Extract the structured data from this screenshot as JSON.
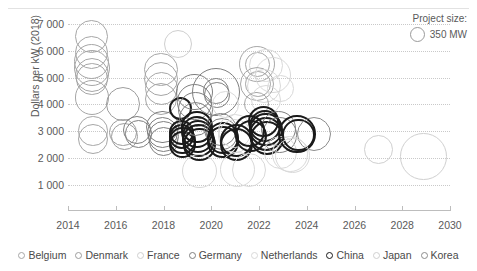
{
  "chart_data": {
    "type": "scatter",
    "title": "",
    "xlabel": "",
    "ylabel": "Dollars per kW (2018)",
    "xlim": [
      2014,
      2030
    ],
    "ylim": [
      500,
      7300
    ],
    "xticks": [
      "2014",
      "2016",
      "2018",
      "2020",
      "2022",
      "2024",
      "2026",
      "2028",
      "2030"
    ],
    "xtick_values": [
      2014,
      2016,
      2018,
      2020,
      2022,
      2024,
      2026,
      2028,
      2030
    ],
    "yticks": [
      "1 000",
      "2 000",
      "3 000",
      "4 000",
      "5 000",
      "6 000",
      "7 000"
    ],
    "ytick_values": [
      1000,
      2000,
      3000,
      4000,
      5000,
      6000,
      7000
    ],
    "grid": true,
    "grid_style": "dotted-horizontal",
    "size_legend": {
      "title": "Project size:",
      "value_label": "350 MW",
      "value_mw": 350
    },
    "legend_position": "bottom",
    "series": [
      {
        "name": "Belgium",
        "color": "#a6a6a6"
      },
      {
        "name": "Denmark",
        "color": "#9d9d9d"
      },
      {
        "name": "France",
        "color": "#cfcfcf"
      },
      {
        "name": "Germany",
        "color": "#7f7f7f"
      },
      {
        "name": "Netherlands",
        "color": "#d9d9d9"
      },
      {
        "name": "China",
        "color": "#1a1a1a"
      },
      {
        "name": "Japan",
        "color": "#d0d0d0"
      },
      {
        "name": "Korea",
        "color": "#8c8c8c"
      }
    ],
    "points": [
      {
        "s": 0,
        "x": 2015.0,
        "y": 6550,
        "mw": 165
      },
      {
        "s": 0,
        "x": 2015.0,
        "y": 5950,
        "mw": 165
      },
      {
        "s": 0,
        "x": 2015.0,
        "y": 5600,
        "mw": 185
      },
      {
        "s": 0,
        "x": 2015.0,
        "y": 5350,
        "mw": 200
      },
      {
        "s": 0,
        "x": 2015.0,
        "y": 5100,
        "mw": 175
      },
      {
        "s": 0,
        "x": 2015.0,
        "y": 4950,
        "mw": 150
      },
      {
        "s": 0,
        "x": 2015.0,
        "y": 4250,
        "mw": 180
      },
      {
        "s": 0,
        "x": 2015.05,
        "y": 3000,
        "mw": 130
      },
      {
        "s": 0,
        "x": 2015.05,
        "y": 2700,
        "mw": 140
      },
      {
        "s": 1,
        "x": 2016.3,
        "y": 4000,
        "mw": 175
      },
      {
        "s": 1,
        "x": 2016.3,
        "y": 2950,
        "mw": 115
      },
      {
        "s": 1,
        "x": 2016.35,
        "y": 2800,
        "mw": 110
      },
      {
        "s": 3,
        "x": 2016.9,
        "y": 3050,
        "mw": 120
      },
      {
        "s": 3,
        "x": 2016.95,
        "y": 2900,
        "mw": 115
      },
      {
        "s": 0,
        "x": 2017.9,
        "y": 5300,
        "mw": 170
      },
      {
        "s": 0,
        "x": 2017.9,
        "y": 4950,
        "mw": 175
      },
      {
        "s": 0,
        "x": 2017.9,
        "y": 4600,
        "mw": 165
      },
      {
        "s": 0,
        "x": 2017.9,
        "y": 4200,
        "mw": 160
      },
      {
        "s": 3,
        "x": 2017.95,
        "y": 3150,
        "mw": 160
      },
      {
        "s": 3,
        "x": 2017.95,
        "y": 2950,
        "mw": 150
      },
      {
        "s": 3,
        "x": 2018.0,
        "y": 2800,
        "mw": 145
      },
      {
        "s": 3,
        "x": 2018.0,
        "y": 2600,
        "mw": 130
      },
      {
        "s": 2,
        "x": 2018.6,
        "y": 6250,
        "mw": 120
      },
      {
        "s": 5,
        "x": 2018.7,
        "y": 3850,
        "mw": 80
      },
      {
        "s": 5,
        "x": 2018.75,
        "y": 2950,
        "mw": 95
      },
      {
        "s": 5,
        "x": 2018.75,
        "y": 2800,
        "mw": 100
      },
      {
        "s": 5,
        "x": 2018.8,
        "y": 2650,
        "mw": 105
      },
      {
        "s": 5,
        "x": 2018.8,
        "y": 2500,
        "mw": 110
      },
      {
        "s": 3,
        "x": 2019.3,
        "y": 4450,
        "mw": 200
      },
      {
        "s": 3,
        "x": 2019.3,
        "y": 4100,
        "mw": 195
      },
      {
        "s": 3,
        "x": 2019.35,
        "y": 3800,
        "mw": 190
      },
      {
        "s": 3,
        "x": 2019.35,
        "y": 3450,
        "mw": 170
      },
      {
        "s": 5,
        "x": 2019.4,
        "y": 3150,
        "mw": 150
      },
      {
        "s": 5,
        "x": 2019.4,
        "y": 2950,
        "mw": 155
      },
      {
        "s": 5,
        "x": 2019.45,
        "y": 2800,
        "mw": 160
      },
      {
        "s": 5,
        "x": 2019.45,
        "y": 2650,
        "mw": 165
      },
      {
        "s": 5,
        "x": 2019.5,
        "y": 2500,
        "mw": 160
      },
      {
        "s": 4,
        "x": 2019.5,
        "y": 1500,
        "mw": 180
      },
      {
        "s": 3,
        "x": 2020.2,
        "y": 4450,
        "mw": 350
      },
      {
        "s": 3,
        "x": 2020.2,
        "y": 4500,
        "mw": 100
      },
      {
        "s": 3,
        "x": 2020.25,
        "y": 4350,
        "mw": 100
      },
      {
        "s": 4,
        "x": 2020.6,
        "y": 4000,
        "mw": 110
      },
      {
        "s": 3,
        "x": 2020.4,
        "y": 3050,
        "mw": 165
      },
      {
        "s": 3,
        "x": 2020.45,
        "y": 2900,
        "mw": 160
      },
      {
        "s": 5,
        "x": 2020.5,
        "y": 2750,
        "mw": 155
      },
      {
        "s": 5,
        "x": 2020.5,
        "y": 2600,
        "mw": 150
      },
      {
        "s": 4,
        "x": 2021.0,
        "y": 3000,
        "mw": 170
      },
      {
        "s": 4,
        "x": 2021.0,
        "y": 2800,
        "mw": 175
      },
      {
        "s": 5,
        "x": 2021.05,
        "y": 2650,
        "mw": 170
      },
      {
        "s": 5,
        "x": 2021.05,
        "y": 2500,
        "mw": 165
      },
      {
        "s": 4,
        "x": 2021.1,
        "y": 1550,
        "mw": 185
      },
      {
        "s": 4,
        "x": 2021.6,
        "y": 1550,
        "mw": 175
      },
      {
        "s": 0,
        "x": 2021.9,
        "y": 5500,
        "mw": 195
      },
      {
        "s": 0,
        "x": 2021.95,
        "y": 5500,
        "mw": 95
      },
      {
        "s": 4,
        "x": 2022.3,
        "y": 5450,
        "mw": 170
      },
      {
        "s": 4,
        "x": 2022.6,
        "y": 5100,
        "mw": 200
      },
      {
        "s": 0,
        "x": 2021.9,
        "y": 4750,
        "mw": 175
      },
      {
        "s": 0,
        "x": 2021.95,
        "y": 4750,
        "mw": 100
      },
      {
        "s": 4,
        "x": 2022.2,
        "y": 4700,
        "mw": 175
      },
      {
        "s": 4,
        "x": 2022.9,
        "y": 4600,
        "mw": 110
      },
      {
        "s": 0,
        "x": 2021.9,
        "y": 4000,
        "mw": 90
      },
      {
        "s": 4,
        "x": 2022.3,
        "y": 4150,
        "mw": 140
      },
      {
        "s": 5,
        "x": 2022.2,
        "y": 3350,
        "mw": 150
      },
      {
        "s": 5,
        "x": 2022.25,
        "y": 3200,
        "mw": 160
      },
      {
        "s": 5,
        "x": 2022.3,
        "y": 3050,
        "mw": 170
      },
      {
        "s": 5,
        "x": 2022.3,
        "y": 2900,
        "mw": 180
      },
      {
        "s": 5,
        "x": 2022.35,
        "y": 2750,
        "mw": 175
      },
      {
        "s": 3,
        "x": 2022.8,
        "y": 3100,
        "mw": 185
      },
      {
        "s": 3,
        "x": 2022.85,
        "y": 2850,
        "mw": 190
      },
      {
        "s": 4,
        "x": 2022.9,
        "y": 2200,
        "mw": 175
      },
      {
        "s": 4,
        "x": 2023.3,
        "y": 2150,
        "mw": 190
      },
      {
        "s": 5,
        "x": 2021.6,
        "y": 3000,
        "mw": 150
      },
      {
        "s": 5,
        "x": 2021.65,
        "y": 2800,
        "mw": 155
      },
      {
        "s": 5,
        "x": 2023.6,
        "y": 2900,
        "mw": 215
      },
      {
        "s": 5,
        "x": 2023.65,
        "y": 2850,
        "mw": 160
      },
      {
        "s": 7,
        "x": 2024.3,
        "y": 2900,
        "mw": 175
      },
      {
        "s": 4,
        "x": 2023.4,
        "y": 2100,
        "mw": 185
      },
      {
        "s": 6,
        "x": 2027.0,
        "y": 2300,
        "mw": 130
      },
      {
        "s": 6,
        "x": 2028.9,
        "y": 2050,
        "mw": 330
      }
    ]
  }
}
